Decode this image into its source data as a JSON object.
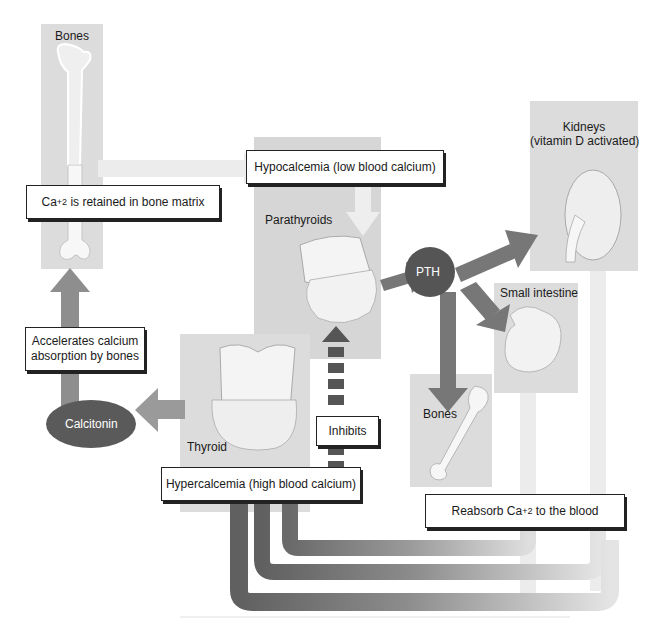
{
  "colors": {
    "panel": "#dcdcdc",
    "arrow_dark": "#6e6e6e",
    "arrow_mid": "#8f8f8f",
    "arrow_light": "#e6e6e6",
    "node_dark": "#555555",
    "box_border": "#222222"
  },
  "panels": {
    "bones_top": {
      "label": "Bones"
    },
    "parathyroids": {
      "label": "Parathyroids"
    },
    "kidneys": {
      "label_line1": "Kidneys",
      "label_line2": "(vitamin D activated)"
    },
    "small_intestine": {
      "label": "Small intestine"
    },
    "bones_bottom": {
      "label": "Bones"
    },
    "thyroid": {
      "label": "Thyroid"
    }
  },
  "nodes": {
    "pth": {
      "label": "PTH"
    },
    "calcitonin": {
      "label": "Calcitonin"
    }
  },
  "boxes": {
    "retained": {
      "prefix": "Ca",
      "sup": "+2",
      "suffix": " is retained in bone matrix"
    },
    "hypocalcemia": {
      "label": "Hypocalcemia (low blood calcium)"
    },
    "accelerates": {
      "line1": "Accelerates calcium",
      "line2": "absorption by bones"
    },
    "inhibits": {
      "label": "Inhibits"
    },
    "hypercalcemia": {
      "label": "Hypercalcemia (high blood calcium)"
    },
    "reabsorb": {
      "prefix": "Reabsorb Ca",
      "sup": "+2",
      "suffix": " to the blood"
    }
  }
}
